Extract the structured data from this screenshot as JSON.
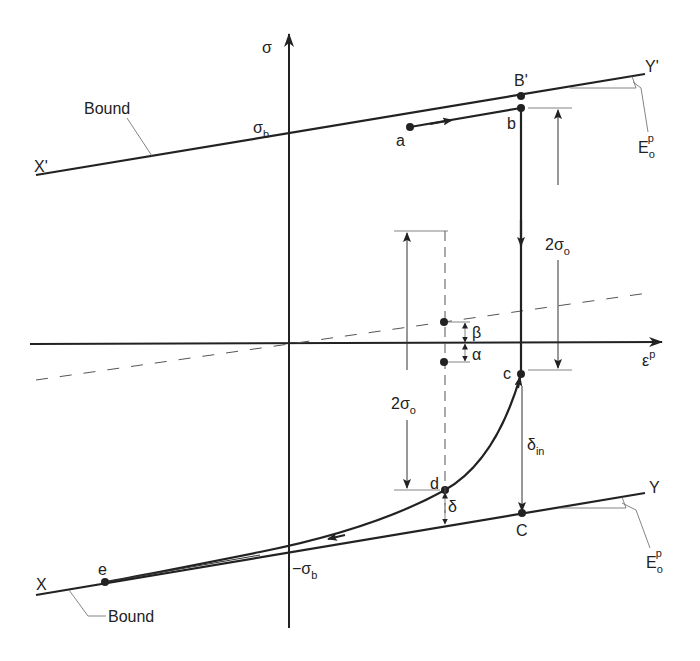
{
  "diagram": {
    "type": "bounding-surface plasticity model (stress vs plastic strain)",
    "axes": {
      "y_label": "σ",
      "x_label": "ε",
      "x_label_sup": "p"
    },
    "bounds": {
      "upper": {
        "start_label": "X'",
        "end_label": "Y'",
        "tag": "Bound",
        "intercept_label": "σ",
        "intercept_sub": "b",
        "slope_label": "E",
        "slope_sub": "o",
        "slope_sup": "p"
      },
      "lower": {
        "start_label": "X",
        "end_label": "Y",
        "tag": "Bound",
        "intercept_label": "−σ",
        "intercept_sub": "b",
        "slope_label": "E",
        "slope_sub": "o",
        "slope_sup": "p"
      }
    },
    "points": {
      "B_prime": "B'",
      "a": "a",
      "b": "b",
      "c": "c",
      "C": "C",
      "d": "d",
      "e": "e"
    },
    "dimensions": {
      "right_range": {
        "label": "2σ",
        "sub": "o"
      },
      "left_range": {
        "label": "2σ",
        "sub": "o"
      },
      "beta": "β",
      "alpha": "α",
      "delta": "δ",
      "delta_in": {
        "label": "δ",
        "sub": "in"
      }
    }
  }
}
